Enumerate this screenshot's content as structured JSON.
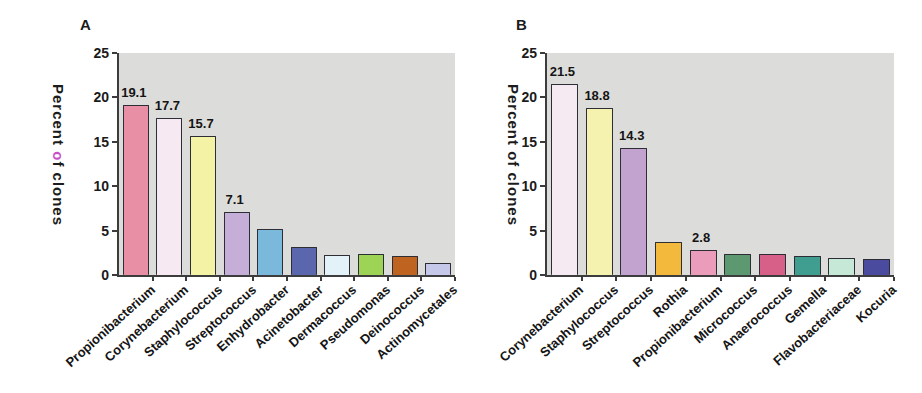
{
  "chart_data": [
    {
      "type": "bar",
      "panel_label": "A",
      "ylabel": "Percent of clones",
      "ylabel_segments": [
        {
          "text": "Percent ",
          "color": ""
        },
        {
          "text": "o",
          "color": "#c94fc9"
        },
        {
          "text": "f clones",
          "color": ""
        }
      ],
      "xlabel": "",
      "ylim": [
        0,
        25
      ],
      "yticks": [
        0,
        5,
        10,
        15,
        20,
        25
      ],
      "grid": false,
      "legend": false,
      "plot_bg": "#dcdcda",
      "categories": [
        "Propionibacterium",
        "Corynebacterium",
        "Staphylococcus",
        "Streptococcus",
        "Enhydrobacter",
        "Acinetobacter",
        "Dermacoccus",
        "Pseudomonas",
        "Deinococcus",
        "Actinomycetales"
      ],
      "values": [
        19.1,
        17.7,
        15.7,
        7.1,
        5.2,
        3.2,
        2.3,
        2.4,
        2.1,
        1.3
      ],
      "data_labels": [
        "19.1",
        "17.7",
        "15.7",
        "7.1",
        "",
        "",
        "",
        "",
        "",
        ""
      ],
      "bar_colors": [
        "#e88fa5",
        "#f7e9f2",
        "#f4f2a4",
        "#c5aed8",
        "#7ab8dc",
        "#5a66ad",
        "#e2f2f8",
        "#9ed455",
        "#bf6420",
        "#c5c8e8"
      ]
    },
    {
      "type": "bar",
      "panel_label": "B",
      "ylabel": "Percent of clones",
      "ylabel_segments": [
        {
          "text": "Percent of clones",
          "color": ""
        }
      ],
      "xlabel": "",
      "ylim": [
        0,
        25
      ],
      "yticks": [
        0,
        5,
        10,
        15,
        20,
        25
      ],
      "grid": false,
      "legend": false,
      "plot_bg": "#dcdcda",
      "categories": [
        "Corynebacterium",
        "Staphylococcus",
        "Streptococcus",
        "Rothia",
        "Propionibacterium",
        "Micrococcus",
        "Anaerococcus",
        "Gemella",
        "Flavobacteriaceae",
        "Kocuria"
      ],
      "values": [
        21.5,
        18.8,
        14.3,
        3.7,
        2.8,
        2.4,
        2.4,
        2.1,
        1.9,
        1.8
      ],
      "data_labels": [
        "21.5",
        "18.8",
        "14.3",
        "",
        "2.8",
        "",
        "",
        "",
        "",
        ""
      ],
      "bar_colors": [
        "#f5e9f2",
        "#f4f2ae",
        "#c2a3d0",
        "#f2b93c",
        "#ea9cba",
        "#5d9970",
        "#d66088",
        "#3f9e90",
        "#c6e8d6",
        "#4a4a9e"
      ]
    }
  ]
}
